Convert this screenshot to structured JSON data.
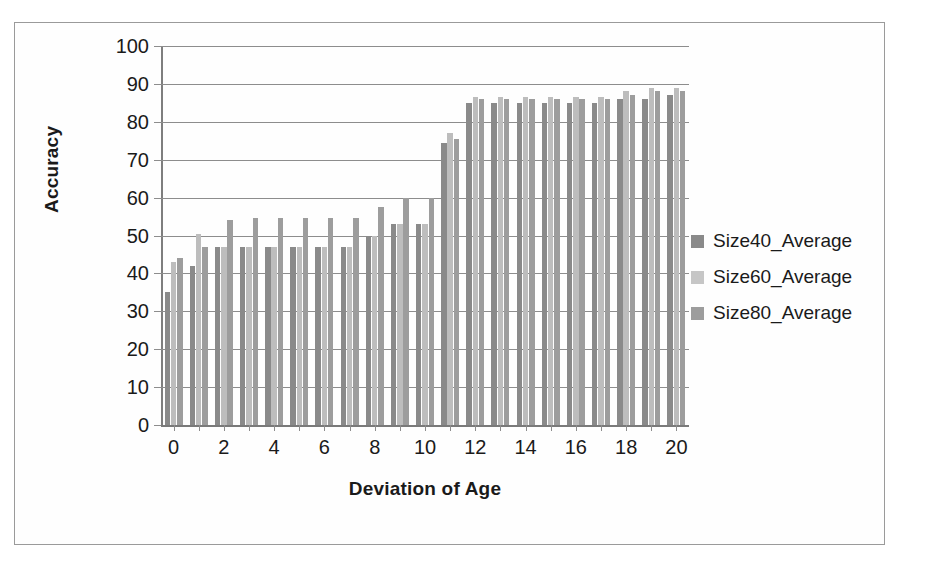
{
  "figure": {
    "frame_border_color": "#9a9a9a",
    "background": "#ffffff"
  },
  "chart_data": {
    "type": "bar",
    "title": "",
    "xlabel": "Deviation of Age",
    "ylabel": "Accuracy",
    "ylim": [
      0,
      100
    ],
    "ytick_step": 10,
    "ytick_labels": [
      "0",
      "10",
      "20",
      "30",
      "40",
      "50",
      "60",
      "70",
      "80",
      "90",
      "100"
    ],
    "grid": true,
    "legend_position": "right",
    "categories": [
      0,
      1,
      2,
      3,
      4,
      5,
      6,
      7,
      8,
      9,
      10,
      11,
      12,
      13,
      14,
      15,
      16,
      17,
      18,
      19,
      20
    ],
    "xtick_labels": [
      "0",
      "",
      "2",
      "",
      "4",
      "",
      "6",
      "",
      "8",
      "",
      "10",
      "",
      "12",
      "",
      "14",
      "",
      "16",
      "",
      "18",
      "",
      "20"
    ],
    "series": [
      {
        "name": "Size40_Average",
        "color": "#8a8a8a",
        "values": [
          35,
          42,
          47,
          47,
          47,
          47,
          47,
          47,
          50,
          53,
          53,
          74.5,
          85,
          85,
          85,
          85,
          85,
          85,
          86,
          86,
          87
        ]
      },
      {
        "name": "Size60_Average",
        "color": "#c6c6c6",
        "values": [
          43,
          50.5,
          47,
          47,
          47,
          47,
          47,
          47,
          50,
          53,
          53,
          77,
          86.5,
          86.5,
          86.5,
          86.5,
          86.5,
          86.5,
          88,
          89,
          89
        ]
      },
      {
        "name": "Size80_Average",
        "color": "#9d9d9d",
        "values": [
          44,
          47,
          54,
          54.5,
          54.5,
          54.5,
          54.5,
          54.5,
          57.5,
          60,
          60,
          75.5,
          86,
          86,
          86,
          86,
          86,
          86,
          87,
          88,
          88
        ]
      }
    ]
  },
  "legend": {
    "items": [
      {
        "label": "Size40_Average",
        "swatch_class": "s0"
      },
      {
        "label": "Size60_Average",
        "swatch_class": "s1"
      },
      {
        "label": "Size80_Average",
        "swatch_class": "s2"
      }
    ]
  }
}
